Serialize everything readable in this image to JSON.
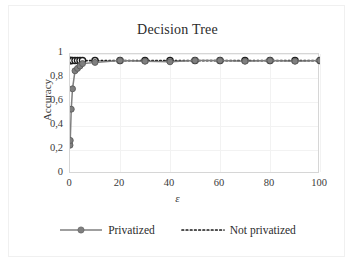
{
  "chart_data": {
    "type": "line",
    "title": "Decision Tree",
    "xlabel": "ε",
    "ylabel": "Accuracy",
    "xlim": [
      0,
      100
    ],
    "ylim": [
      0,
      1
    ],
    "grid": true,
    "legend_position": "bottom",
    "xticks": [
      "0",
      "20",
      "40",
      "60",
      "80",
      "100"
    ],
    "xtick_values": [
      0,
      20,
      40,
      60,
      80,
      100
    ],
    "yticks": [
      "0",
      "0,2",
      "0,4",
      "0,6",
      "0,8",
      "1"
    ],
    "ytick_values": [
      0,
      0.2,
      0.4,
      0.6,
      0.8,
      1
    ],
    "series": [
      {
        "name": "Privatized",
        "style": "solid-with-circle-markers",
        "color": "#7f7f7f",
        "x": [
          0,
          0.1,
          0.5,
          1,
          2,
          3,
          4,
          5,
          10,
          20,
          30,
          40,
          50,
          60,
          70,
          80,
          90,
          100
        ],
        "values": [
          0.24,
          0.28,
          0.54,
          0.71,
          0.86,
          0.88,
          0.9,
          0.92,
          0.93,
          0.945,
          0.94,
          0.935,
          0.945,
          0.945,
          0.94,
          0.945,
          0.94,
          0.945
        ]
      },
      {
        "name": "Not privatized",
        "style": "dotted",
        "color": "#1a1a1a",
        "x": [
          0,
          0.1,
          0.5,
          1,
          2,
          3,
          4,
          5,
          10,
          20,
          30,
          40,
          50,
          60,
          70,
          80,
          90,
          100
        ],
        "values": [
          0.945,
          0.945,
          0.945,
          0.945,
          0.945,
          0.945,
          0.945,
          0.945,
          0.945,
          0.945,
          0.945,
          0.945,
          0.945,
          0.945,
          0.945,
          0.945,
          0.945,
          0.945
        ]
      }
    ]
  },
  "legend": {
    "items": [
      {
        "label": "Privatized"
      },
      {
        "label": "Not privatized"
      }
    ]
  },
  "colors": {
    "privatized": "#7f7f7f",
    "not_privatized": "#1a1a1a",
    "grid": "#f2f2f2",
    "axis": "#d6d6d6",
    "text": "#3a3a3a"
  }
}
